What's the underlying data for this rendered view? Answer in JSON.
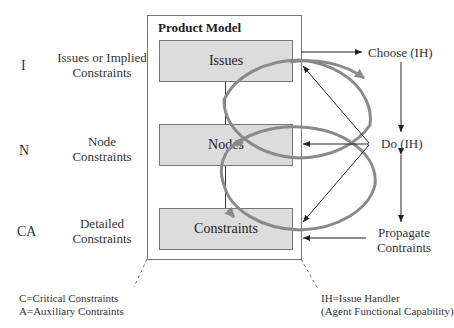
{
  "product_model": {
    "title": "Product Model",
    "layers": [
      {
        "id": "issues",
        "label": "Issues"
      },
      {
        "id": "nodes",
        "label": "Nodes"
      },
      {
        "id": "constraints",
        "label": "Constraints"
      }
    ]
  },
  "left_labels": [
    {
      "code": "I",
      "description_line1": "Issues or Implied",
      "description_line2": "Constraints"
    },
    {
      "code": "N",
      "description_line1": "Node",
      "description_line2": "Constraints"
    },
    {
      "code": "CA",
      "description_line1": "Detailed",
      "description_line2": "Constraints"
    }
  ],
  "right_labels": {
    "choose": "Choose (IH)",
    "do": "Do (IH)",
    "propagate_line1": "Propagate",
    "propagate_line2": "Contraints"
  },
  "legend": {
    "left_line1": "C=Critical Constraints",
    "left_line2": "A=Auxiliary Contraints",
    "right_line1": "IH=Issue Handler",
    "right_line2": "(Agent Functional Capability)"
  },
  "colors": {
    "ellipse": "#8a8a8a",
    "layer_fill": "#dcdcdc",
    "line": "#333333"
  }
}
